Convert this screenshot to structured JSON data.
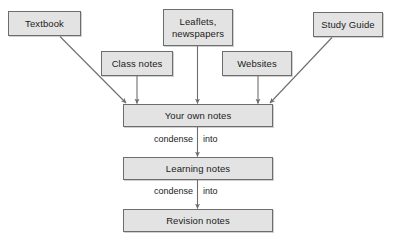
{
  "diagram": {
    "style": {
      "node_fill": "#e3e3e3",
      "node_border": "#6d6d6d",
      "text_color": "#1b1b1b",
      "connector_color": "#6d6d6d",
      "background": "#ffffff"
    },
    "sources": {
      "textbook": "Textbook",
      "leaflets_line1": "Leaflets,",
      "leaflets_line2": "newspapers",
      "study_guide": "Study Guide",
      "class_notes": "Class notes",
      "websites": "Websites"
    },
    "chain": {
      "your_own_notes": "Your own notes",
      "learning_notes": "Learning notes",
      "revision_notes": "Revision notes"
    },
    "edge_labels": {
      "condense_1": "condense",
      "into_1": "into",
      "condense_2": "condense",
      "into_2": "into"
    }
  }
}
